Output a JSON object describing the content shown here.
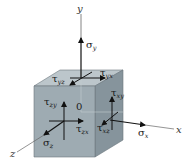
{
  "diagram": {
    "type": "3d-stress-element",
    "colors": {
      "front_face": "#9aa7ae",
      "top_face": "#bcc6cb",
      "side_face": "#7f8d95",
      "edge": "#5f6b72",
      "axis": "#555555",
      "arrow": "#111111"
    },
    "axes": {
      "x": "x",
      "y": "y",
      "z": "z"
    },
    "origin_label": "0",
    "stresses": {
      "sigma_y": {
        "sym": "σ",
        "sub": "y"
      },
      "sigma_x": {
        "sym": "σ",
        "sub": "x"
      },
      "sigma_z": {
        "sym": "σ",
        "sub": "z"
      },
      "tau_yz": {
        "sym": "τ",
        "sub": "yz"
      },
      "tau_yx": {
        "sym": "τ",
        "sub": "yx"
      },
      "tau_zy": {
        "sym": "τ",
        "sub": "zy"
      },
      "tau_zx": {
        "sym": "τ",
        "sub": "zx"
      },
      "tau_xy": {
        "sym": "τ",
        "sub": "xy"
      },
      "tau_xz": {
        "sym": "τ",
        "sub": "xz"
      }
    }
  }
}
